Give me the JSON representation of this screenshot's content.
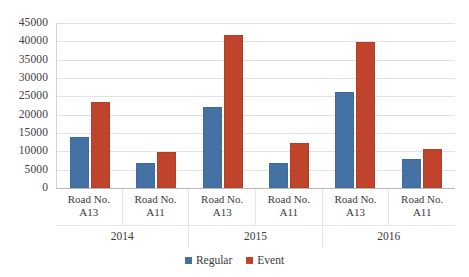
{
  "chart_data": {
    "type": "bar",
    "title": "",
    "xlabel": "",
    "ylabel": "",
    "ylim": [
      0,
      45000
    ],
    "ytick_step": 5000,
    "grid": true,
    "legend_position": "bottom",
    "categories": [
      "Road No. A13",
      "Road No. A11",
      "Road No. A13",
      "Road No. A11",
      "Road No. A13",
      "Road No. A11"
    ],
    "category_lines": [
      [
        "Road No.",
        "A13"
      ],
      [
        "Road No.",
        "A11"
      ],
      [
        "Road No.",
        "A13"
      ],
      [
        "Road No.",
        "A11"
      ],
      [
        "Road No.",
        "A13"
      ],
      [
        "Road No.",
        "A11"
      ]
    ],
    "groups": [
      "2014",
      "2015",
      "2016"
    ],
    "group_span": 2,
    "series": [
      {
        "name": "Regular",
        "color": "#4472a4",
        "values": [
          14000,
          6800,
          22000,
          6800,
          26300,
          7800
        ]
      },
      {
        "name": "Event",
        "color": "#c0442b",
        "values": [
          23400,
          9700,
          41600,
          12200,
          39800,
          10700
        ]
      }
    ],
    "ytick_labels": [
      "45000",
      "40000",
      "35000",
      "30000",
      "25000",
      "20000",
      "15000",
      "10000",
      "5000",
      "0"
    ],
    "ytick_values": [
      45000,
      40000,
      35000,
      30000,
      25000,
      20000,
      15000,
      10000,
      5000,
      0
    ]
  },
  "legend": {
    "items": [
      {
        "label": "Regular",
        "color": "#4472a4"
      },
      {
        "label": "Event",
        "color": "#c0442b"
      }
    ]
  }
}
